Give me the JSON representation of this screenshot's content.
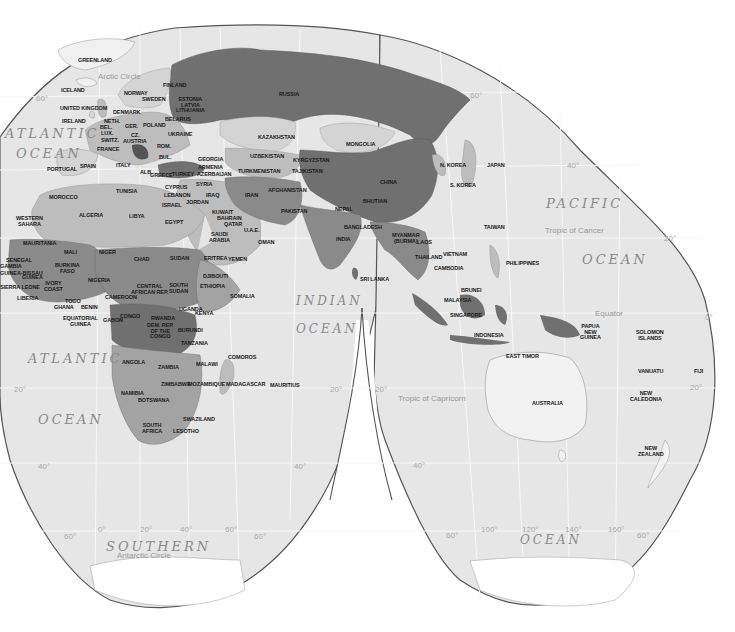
{
  "map": {
    "title": "World Political Map (Goode Homolosine, Eastern Hemisphere focus)",
    "colors": {
      "background": "#ffffff",
      "ocean": "#e6e6e6",
      "outline": "#555555",
      "graticule": "#f6f6f6",
      "shade_1": "#d4d4d4",
      "shade_2": "#bdbdbd",
      "shade_3": "#a3a3a3",
      "shade_4": "#8a8a8a",
      "shade_5": "#707070",
      "land_unshaded": "#f0f0f0"
    },
    "oceans": [
      {
        "id": "atlantic-n-1",
        "text": "ATLANTIC",
        "x": 5,
        "y": 126,
        "size": 13
      },
      {
        "id": "atlantic-n-2",
        "text": "OCEAN",
        "x": 16,
        "y": 146,
        "size": 13
      },
      {
        "id": "pacific-1",
        "text": "PACIFIC",
        "x": 546,
        "y": 196,
        "size": 13
      },
      {
        "id": "pacific-2",
        "text": "OCEAN",
        "x": 582,
        "y": 252,
        "size": 13
      },
      {
        "id": "indian-1",
        "text": "INDIAN",
        "x": 296,
        "y": 294,
        "size": 12
      },
      {
        "id": "indian-2",
        "text": "OCEAN",
        "x": 296,
        "y": 322,
        "size": 12
      },
      {
        "id": "atlantic-s-1",
        "text": "ATLANTIC",
        "x": 28,
        "y": 351,
        "size": 13
      },
      {
        "id": "atlantic-s-2",
        "text": "OCEAN",
        "x": 38,
        "y": 412,
        "size": 13
      },
      {
        "id": "southern-1",
        "text": "SOUTHERN",
        "x": 106,
        "y": 539,
        "size": 13
      },
      {
        "id": "southern-2",
        "text": "OCEAN",
        "x": 520,
        "y": 533,
        "size": 12
      }
    ],
    "lines": [
      {
        "id": "arctic-circle",
        "text": "Arctic Circle",
        "x": 98,
        "y": 72
      },
      {
        "id": "tropic-cancer",
        "text": "Tropic of Cancer",
        "x": 545,
        "y": 226
      },
      {
        "id": "equator",
        "text": "Equator",
        "x": 595,
        "y": 309
      },
      {
        "id": "tropic-capricorn",
        "text": "Tropic of Capricorn",
        "x": 398,
        "y": 394
      },
      {
        "id": "antarctic-circle",
        "text": "Antarctic Circle",
        "x": 117,
        "y": 551
      }
    ],
    "degrees": [
      {
        "text": "60°",
        "x": 36,
        "y": 94
      },
      {
        "text": "60°",
        "x": 470,
        "y": 91
      },
      {
        "text": "40°",
        "x": 567,
        "y": 161
      },
      {
        "text": "20°",
        "x": 664,
        "y": 234
      },
      {
        "text": "0°",
        "x": 705,
        "y": 313
      },
      {
        "text": "20°",
        "x": 14,
        "y": 385
      },
      {
        "text": "20°",
        "x": 330,
        "y": 385
      },
      {
        "text": "20°",
        "x": 375,
        "y": 385
      },
      {
        "text": "20°",
        "x": 690,
        "y": 383
      },
      {
        "text": "40°",
        "x": 38,
        "y": 462
      },
      {
        "text": "40°",
        "x": 294,
        "y": 462
      },
      {
        "text": "40°",
        "x": 413,
        "y": 461
      },
      {
        "text": "60°",
        "x": 64,
        "y": 532
      },
      {
        "text": "0°",
        "x": 98,
        "y": 525
      },
      {
        "text": "20°",
        "x": 140,
        "y": 525
      },
      {
        "text": "40°",
        "x": 180,
        "y": 525
      },
      {
        "text": "60°",
        "x": 225,
        "y": 525
      },
      {
        "text": "60°",
        "x": 254,
        "y": 532
      },
      {
        "text": "60°",
        "x": 446,
        "y": 531
      },
      {
        "text": "100°",
        "x": 481,
        "y": 525
      },
      {
        "text": "120°",
        "x": 522,
        "y": 525
      },
      {
        "text": "140°",
        "x": 565,
        "y": 525
      },
      {
        "text": "160°",
        "x": 608,
        "y": 525
      },
      {
        "text": "60°",
        "x": 637,
        "y": 531
      }
    ],
    "countries": [
      {
        "name": "GREENLAND",
        "x": 78,
        "y": 58
      },
      {
        "name": "ICELAND",
        "x": 61,
        "y": 88
      },
      {
        "name": "UNITED KINGDOM",
        "x": 60,
        "y": 106
      },
      {
        "name": "IRELAND",
        "x": 62,
        "y": 119
      },
      {
        "name": "NORWAY",
        "x": 124,
        "y": 91
      },
      {
        "name": "SWEDEN",
        "x": 142,
        "y": 97
      },
      {
        "name": "FINLAND",
        "x": 163,
        "y": 83
      },
      {
        "name": "DENMARK",
        "x": 113,
        "y": 110
      },
      {
        "name": "ESTONIA\nLATVIA\nLITHUANIA",
        "x": 176,
        "y": 97
      },
      {
        "name": "NETH.",
        "x": 104,
        "y": 119
      },
      {
        "name": "BEL.",
        "x": 100,
        "y": 125
      },
      {
        "name": "LUX.",
        "x": 101,
        "y": 131
      },
      {
        "name": "GER.",
        "x": 125,
        "y": 124
      },
      {
        "name": "POLAND",
        "x": 143,
        "y": 123
      },
      {
        "name": "BELARUS",
        "x": 165,
        "y": 117
      },
      {
        "name": "UKRAINE",
        "x": 168,
        "y": 132
      },
      {
        "name": "CZ.",
        "x": 131,
        "y": 133
      },
      {
        "name": "SWITZ.",
        "x": 101,
        "y": 138
      },
      {
        "name": "AUSTRIA",
        "x": 123,
        "y": 139
      },
      {
        "name": "FRANCE",
        "x": 97,
        "y": 147
      },
      {
        "name": "ROM.",
        "x": 157,
        "y": 144
      },
      {
        "name": "BUL.",
        "x": 159,
        "y": 155
      },
      {
        "name": "ITALY",
        "x": 116,
        "y": 163
      },
      {
        "name": "ALB.",
        "x": 140,
        "y": 170
      },
      {
        "name": "GREECE",
        "x": 150,
        "y": 173
      },
      {
        "name": "PORTUGAL",
        "x": 47,
        "y": 167
      },
      {
        "name": "SPAIN",
        "x": 80,
        "y": 164
      },
      {
        "name": "GEORGIA",
        "x": 198,
        "y": 157
      },
      {
        "name": "ARMENIA",
        "x": 198,
        "y": 165
      },
      {
        "name": "AZERBAIJAN",
        "x": 197,
        "y": 172
      },
      {
        "name": "TURKEY",
        "x": 172,
        "y": 172
      },
      {
        "name": "CYPRUS",
        "x": 165,
        "y": 185
      },
      {
        "name": "SYRIA",
        "x": 196,
        "y": 182
      },
      {
        "name": "LEBANON",
        "x": 164,
        "y": 193
      },
      {
        "name": "ISRAEL",
        "x": 162,
        "y": 203
      },
      {
        "name": "JORDAN",
        "x": 186,
        "y": 200
      },
      {
        "name": "IRAQ",
        "x": 206,
        "y": 193
      },
      {
        "name": "IRAN",
        "x": 245,
        "y": 193
      },
      {
        "name": "KUWAIT",
        "x": 212,
        "y": 210
      },
      {
        "name": "BAHRAIN",
        "x": 217,
        "y": 216
      },
      {
        "name": "QATAR",
        "x": 224,
        "y": 222
      },
      {
        "name": "SAUDI\nARABIA",
        "x": 209,
        "y": 232
      },
      {
        "name": "U.A.E.",
        "x": 244,
        "y": 228
      },
      {
        "name": "OMAN",
        "x": 258,
        "y": 240
      },
      {
        "name": "YEMEN",
        "x": 228,
        "y": 257
      },
      {
        "name": "KAZAKHSTAN",
        "x": 258,
        "y": 135
      },
      {
        "name": "UZBEKISTAN",
        "x": 250,
        "y": 154
      },
      {
        "name": "TURKMENISTAN",
        "x": 238,
        "y": 169
      },
      {
        "name": "KYRGYZSTAN",
        "x": 293,
        "y": 158
      },
      {
        "name": "TAJIKISTAN",
        "x": 292,
        "y": 169
      },
      {
        "name": "AFGHANISTAN",
        "x": 268,
        "y": 188
      },
      {
        "name": "PAKISTAN",
        "x": 281,
        "y": 209
      },
      {
        "name": "INDIA",
        "x": 336,
        "y": 237
      },
      {
        "name": "NEPAL",
        "x": 335,
        "y": 207
      },
      {
        "name": "BHUTIAN",
        "x": 363,
        "y": 199
      },
      {
        "name": "BANGLADESH",
        "x": 344,
        "y": 225
      },
      {
        "name": "SRI LANKA",
        "x": 360,
        "y": 277
      },
      {
        "name": "RUSSIA",
        "x": 279,
        "y": 92
      },
      {
        "name": "MONGOLIA",
        "x": 346,
        "y": 142
      },
      {
        "name": "CHINA",
        "x": 380,
        "y": 180
      },
      {
        "name": "N. KOREA",
        "x": 440,
        "y": 163
      },
      {
        "name": "S. KOREA",
        "x": 450,
        "y": 183
      },
      {
        "name": "JAPAN",
        "x": 487,
        "y": 163
      },
      {
        "name": "TAIWAN",
        "x": 484,
        "y": 225
      },
      {
        "name": "MYANMAR\n(BURMA)",
        "x": 392,
        "y": 233
      },
      {
        "name": "LAOS",
        "x": 417,
        "y": 240
      },
      {
        "name": "THAILAND",
        "x": 415,
        "y": 255
      },
      {
        "name": "VIETNAM",
        "x": 443,
        "y": 252
      },
      {
        "name": "CAMBODIA",
        "x": 434,
        "y": 266
      },
      {
        "name": "PHILIPPINES",
        "x": 506,
        "y": 261
      },
      {
        "name": "BRUNEI",
        "x": 461,
        "y": 288
      },
      {
        "name": "MALAYSIA",
        "x": 444,
        "y": 298
      },
      {
        "name": "SINGAPORE",
        "x": 450,
        "y": 313
      },
      {
        "name": "INDONESIA",
        "x": 474,
        "y": 333
      },
      {
        "name": "EAST TIMOR",
        "x": 506,
        "y": 354
      },
      {
        "name": "PAPUA\nNEW\nGUINEA",
        "x": 580,
        "y": 324
      },
      {
        "name": "SOLOMON\nISLANDS",
        "x": 636,
        "y": 330
      },
      {
        "name": "VANUATU",
        "x": 638,
        "y": 369
      },
      {
        "name": "FIJI",
        "x": 694,
        "y": 369
      },
      {
        "name": "NEW\nCALEDONIA",
        "x": 630,
        "y": 391
      },
      {
        "name": "AUSTRALIA",
        "x": 532,
        "y": 401
      },
      {
        "name": "NEW\nZEALAND",
        "x": 638,
        "y": 446
      },
      {
        "name": "MOROCCO",
        "x": 49,
        "y": 195
      },
      {
        "name": "ALGERIA",
        "x": 79,
        "y": 213
      },
      {
        "name": "TUNISIA",
        "x": 116,
        "y": 189
      },
      {
        "name": "LIBYA",
        "x": 129,
        "y": 214
      },
      {
        "name": "EGYPT",
        "x": 165,
        "y": 220
      },
      {
        "name": "WESTERN\nSAHARA",
        "x": 16,
        "y": 216
      },
      {
        "name": "MAURITANIA",
        "x": 23,
        "y": 241
      },
      {
        "name": "MALI",
        "x": 64,
        "y": 250
      },
      {
        "name": "NIGER",
        "x": 99,
        "y": 250
      },
      {
        "name": "CHAD",
        "x": 134,
        "y": 257
      },
      {
        "name": "SUDAN",
        "x": 170,
        "y": 256
      },
      {
        "name": "ERITREA",
        "x": 204,
        "y": 256
      },
      {
        "name": "DJIBOUTI",
        "x": 203,
        "y": 274
      },
      {
        "name": "ETHIOPIA",
        "x": 200,
        "y": 284
      },
      {
        "name": "SOMALIA",
        "x": 230,
        "y": 294
      },
      {
        "name": "SENEGAL",
        "x": 6,
        "y": 258
      },
      {
        "name": "GAMBIA",
        "x": 0,
        "y": 264
      },
      {
        "name": "GUINEA-BISSAU",
        "x": 0,
        "y": 271
      },
      {
        "name": "GUINEA",
        "x": 22,
        "y": 275
      },
      {
        "name": "SIERRA LEONE",
        "x": 0,
        "y": 285
      },
      {
        "name": "LIBERIA",
        "x": 17,
        "y": 296
      },
      {
        "name": "BURKINA\nFASO",
        "x": 55,
        "y": 263
      },
      {
        "name": "IVORY\nCOAST",
        "x": 44,
        "y": 281
      },
      {
        "name": "GHANA",
        "x": 54,
        "y": 305
      },
      {
        "name": "TOGO",
        "x": 65,
        "y": 299
      },
      {
        "name": "BENIN",
        "x": 81,
        "y": 305
      },
      {
        "name": "NIGERIA",
        "x": 88,
        "y": 278
      },
      {
        "name": "CAMEROON",
        "x": 105,
        "y": 295
      },
      {
        "name": "CENTRAL\nAFRICAN REP.",
        "x": 131,
        "y": 284
      },
      {
        "name": "SOUTH\nSUDAN",
        "x": 169,
        "y": 283
      },
      {
        "name": "EQUATORIAL\nGUINEA",
        "x": 63,
        "y": 316
      },
      {
        "name": "GABON",
        "x": 103,
        "y": 318
      },
      {
        "name": "CONGO",
        "x": 120,
        "y": 314
      },
      {
        "name": "UGANDA",
        "x": 179,
        "y": 307
      },
      {
        "name": "KENYA",
        "x": 195,
        "y": 311
      },
      {
        "name": "RWANDA",
        "x": 151,
        "y": 316
      },
      {
        "name": "BURUNDI",
        "x": 178,
        "y": 328
      },
      {
        "name": "DEM. REP.\nOF THE\nCONGO",
        "x": 147,
        "y": 323
      },
      {
        "name": "TANZANIA",
        "x": 181,
        "y": 341
      },
      {
        "name": "ANGOLA",
        "x": 122,
        "y": 360
      },
      {
        "name": "ZAMBIA",
        "x": 158,
        "y": 365
      },
      {
        "name": "MALAWI",
        "x": 196,
        "y": 362
      },
      {
        "name": "COMOROS",
        "x": 228,
        "y": 355
      },
      {
        "name": "ZIMBABWE",
        "x": 161,
        "y": 382
      },
      {
        "name": "MOZAMBIQUE",
        "x": 188,
        "y": 382
      },
      {
        "name": "MADAGASCAR",
        "x": 226,
        "y": 382
      },
      {
        "name": "MAURITIUS",
        "x": 270,
        "y": 383
      },
      {
        "name": "NAMIBIA",
        "x": 121,
        "y": 391
      },
      {
        "name": "BOTSWANA",
        "x": 138,
        "y": 398
      },
      {
        "name": "SWAZILAND",
        "x": 183,
        "y": 417
      },
      {
        "name": "SOUTH\nAFRICA",
        "x": 142,
        "y": 423
      },
      {
        "name": "LESOTHO",
        "x": 173,
        "y": 429
      }
    ]
  }
}
